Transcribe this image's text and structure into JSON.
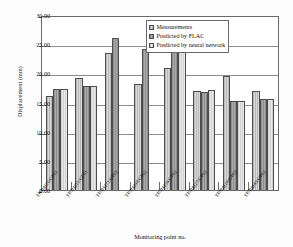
{
  "chart_data": {
    "type": "bar",
    "title": "",
    "xlabel": "Monitoring point no.",
    "ylabel": "Displacement (mm)",
    "ylim": [
      0,
      30
    ],
    "yticks": [
      "0.00",
      "5.00",
      "10.00",
      "15.00",
      "20.00",
      "25.00",
      "30.00"
    ],
    "grid": true,
    "legend_position": "top-right",
    "categories": [
      "TP/BM10/GP01",
      "TP/BM11/GP01",
      "TP/BM71/GP02",
      "TP/BM98/GP02",
      "TP/BM56/GP02",
      "TP/BM27/GP02",
      "TP/BM28/GP02",
      "TP/BM49/GP02"
    ],
    "series": [
      {
        "name": "Measurements",
        "values": [
          16.2,
          19.2,
          23.5,
          18.1,
          20.9,
          16.9,
          19.5,
          17.0
        ]
      },
      {
        "name": "Predicted by FLAC",
        "values": [
          17.3,
          17.8,
          26.1,
          24.1,
          23.8,
          16.8,
          15.2,
          15.6
        ]
      },
      {
        "name": "Predicted by neural network",
        "values": [
          17.3,
          17.9,
          null,
          null,
          23.9,
          17.1,
          15.3,
          15.6
        ]
      }
    ]
  },
  "legend": {
    "items": [
      "Measurements",
      "Predicted by FLAC",
      "Predicted by neural network"
    ]
  },
  "axes": {
    "y_title": "Displacement (mm)",
    "x_title": "Monitoring point no."
  }
}
